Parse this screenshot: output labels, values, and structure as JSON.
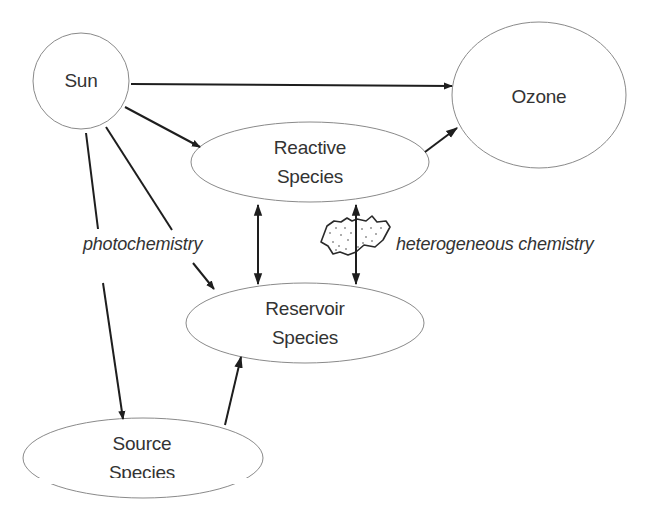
{
  "nodes": {
    "sun": {
      "label": "Sun"
    },
    "ozone": {
      "label": "Ozone"
    },
    "reactive": {
      "line1": "Reactive",
      "line2": "Species"
    },
    "reservoir": {
      "line1": "Reservoir",
      "line2": "Species"
    },
    "source": {
      "line1": "Source",
      "line2": "Species"
    }
  },
  "edge_labels": {
    "photochemistry": "photochemistry",
    "heterogeneous": "heterogeneous chemistry"
  },
  "edges": [
    {
      "from": "Sun",
      "to": "Ozone",
      "type": "arrow"
    },
    {
      "from": "Sun",
      "to": "Reactive Species",
      "type": "arrow"
    },
    {
      "from": "Sun",
      "to": "Reservoir Species",
      "type": "arrow",
      "label": "photochemistry"
    },
    {
      "from": "Sun",
      "to": "Source Species",
      "type": "arrow",
      "label": "photochemistry"
    },
    {
      "from": "Reactive Species",
      "to": "Ozone",
      "type": "arrow"
    },
    {
      "from": "Reactive Species",
      "to": "Reservoir Species",
      "type": "bidirectional"
    },
    {
      "from": "Reactive Species",
      "to": "Reservoir Species",
      "type": "bidirectional",
      "label": "heterogeneous chemistry"
    },
    {
      "from": "Source Species",
      "to": "Reservoir Species",
      "type": "arrow"
    }
  ],
  "colors": {
    "stroke": "#1e1e1e",
    "outline": "#8a8a8a",
    "text": "#333333"
  }
}
